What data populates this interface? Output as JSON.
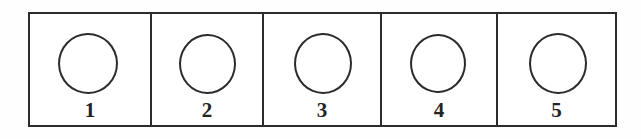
{
  "diagram": {
    "type": "labelled-cell-row",
    "frame": {
      "border_color": "#2c2c2c",
      "background_color": "#ffffff"
    },
    "shape": {
      "name": "circle",
      "fill": "none",
      "stroke_color": "#2b2b2b"
    },
    "cells": [
      {
        "label": "1",
        "shape": "circle"
      },
      {
        "label": "2",
        "shape": "circle"
      },
      {
        "label": "3",
        "shape": "circle"
      },
      {
        "label": "4",
        "shape": "circle"
      },
      {
        "label": "5",
        "shape": "circle"
      }
    ]
  }
}
